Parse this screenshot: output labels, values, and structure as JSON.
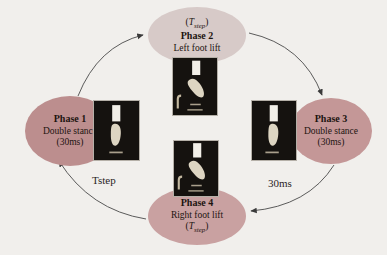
{
  "colors": {
    "background": "#f1efec",
    "phase1_fill": "#bc8e8e",
    "phase2_fill": "#d7cac8",
    "phase3_fill": "#c49797",
    "phase4_fill": "#c9a1a1",
    "arrow_stroke": "#4a4a4a",
    "text": "#1c1410",
    "photo_background": "#15120f"
  },
  "tstep": {
    "open": "(",
    "symbol": "T",
    "subscript": "step",
    "close": ")"
  },
  "phases": {
    "phase1": {
      "name": "Phase 1",
      "desc": "Double stance",
      "duration": "(30ms)"
    },
    "phase2": {
      "name": "Phase 2",
      "desc": "Left foot lift"
    },
    "phase3": {
      "name": "Phase 3",
      "desc": "Double stance",
      "duration": "(30ms)"
    },
    "phase4": {
      "name": "Phase 4",
      "desc": "Right foot lift"
    }
  },
  "arrow_labels": {
    "phase4_to_phase1": "Tstep",
    "phase3_to_phase4": "30ms"
  },
  "photos": {
    "left": "robot-foot-double-stance-photo",
    "top": "robot-foot-left-lift-photo",
    "right": "robot-foot-double-stance-photo",
    "bottom": "robot-foot-right-lift-photo"
  }
}
